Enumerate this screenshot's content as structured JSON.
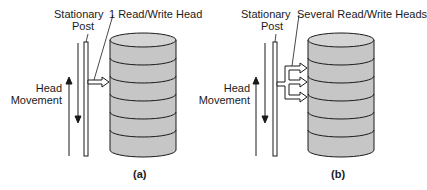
{
  "figure": {
    "colors": {
      "stroke": "#1a1a1a",
      "disk_fill": "#c6c6c6",
      "disk_top": "#d4d4d4",
      "background": "#ffffff"
    },
    "panels": [
      {
        "id": "a",
        "caption": "(a)",
        "post_label_line1": "Stationary",
        "post_label_line2": "Post",
        "head_label": "1 Read/Write Head",
        "movement_label_line1": "Head",
        "movement_label_line2": "Movement",
        "platter_count": 7,
        "head_count": 1
      },
      {
        "id": "b",
        "caption": "(b)",
        "post_label_line1": "Stationary",
        "post_label_line2": "Post",
        "head_label": "Several Read/Write Heads",
        "movement_label_line1": "Head",
        "movement_label_line2": "Movement",
        "platter_count": 7,
        "head_count": 3
      }
    ]
  }
}
